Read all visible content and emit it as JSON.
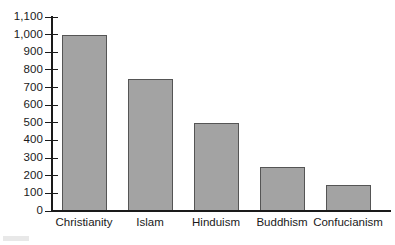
{
  "chart_data": {
    "type": "bar",
    "title": "",
    "subtitle": "",
    "xlabel": "",
    "ylabel": "",
    "categories": [
      "Christianity",
      "Islam",
      "Hinduism",
      "Buddhism",
      "Confucianism"
    ],
    "values": [
      1000,
      750,
      500,
      250,
      150
    ],
    "series": [
      {
        "name": "Adherents",
        "values": [
          1000,
          750,
          500,
          250,
          150
        ]
      }
    ],
    "ylim": [
      0,
      1100
    ],
    "ytick_step": 100,
    "ytick_values": [
      0,
      100,
      200,
      300,
      400,
      500,
      600,
      700,
      800,
      900,
      1000,
      1100
    ],
    "ytick_labels": [
      "0",
      "100",
      "200",
      "300",
      "400",
      "500",
      "600",
      "700",
      "800",
      "900",
      "1,000",
      "1,100"
    ],
    "grid": false,
    "legend": false,
    "legend_position": "none",
    "annotations": [],
    "colors": {
      "bar_fill": "#a3a3a3",
      "bar_stroke": "#555555",
      "axis": "#1a1a1a",
      "text": "#1a1a1a",
      "background": "#ffffff"
    }
  }
}
